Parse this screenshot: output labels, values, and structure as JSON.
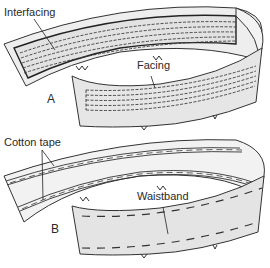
{
  "figure": {
    "panels": [
      {
        "id": "A",
        "label": "A",
        "callouts": [
          {
            "text": "Interfacing"
          },
          {
            "text": "Facing"
          }
        ]
      },
      {
        "id": "B",
        "label": "B",
        "callouts": [
          {
            "text": "Cotton tape"
          },
          {
            "text": "Waistband"
          }
        ]
      }
    ],
    "colors": {
      "fabric_fill": "#e6e6e6",
      "fabric_light": "#f1f1f1",
      "outline": "#333333",
      "stitch": "#3a3a3a",
      "background": "#ffffff"
    }
  }
}
